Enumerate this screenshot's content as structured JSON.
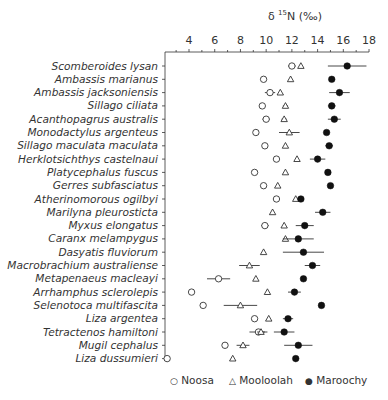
{
  "chart_data": {
    "type": "scatter",
    "title": "",
    "xlabel": "δ 15N (‰)",
    "xlabel_parts": {
      "delta": "δ",
      "sup": "15",
      "rest": "N (‰)"
    },
    "ylabel": "",
    "xlim": [
      2,
      18
    ],
    "xticks": [
      4,
      6,
      8,
      10,
      12,
      14,
      16,
      18
    ],
    "x_axis_position": "top",
    "grid": false,
    "legend_position": "bottom",
    "categories": [
      "Scomberoides lysan",
      "Ambassis marianus",
      "Ambassis jacksoniensis",
      "Sillago ciliata",
      "Acanthopagrus australis",
      "Monodactylus argenteus",
      "Sillago maculata maculata",
      "Herklotsichthys castelnaui",
      "Platycephalus fuscus",
      "Gerres subfasciatus",
      "Atherinomorous ogilbyi",
      "Marilyna pleurosticta",
      "Myxus elongatus",
      "Caranx melampygus",
      "Dasyatis fluviorum",
      "Macrobrachium australiense",
      "Metapenaeus macleayi",
      "Arrhamphus sclerolepis",
      "Selenotoca multifascita",
      "Liza argentea",
      "Tetractenos hamiltoni",
      "Mugil cephalus",
      "Liza dussumieri"
    ],
    "series": [
      {
        "name": "Noosa",
        "marker": "open-circle",
        "values": [
          12.0,
          9.8,
          10.3,
          9.7,
          10.0,
          9.2,
          9.9,
          10.8,
          9.1,
          9.8,
          10.8,
          null,
          9.9,
          null,
          null,
          null,
          6.3,
          4.2,
          5.1,
          9.1,
          9.4,
          6.8,
          2.3
        ],
        "errors": [
          0.3,
          0,
          0.4,
          0,
          0.3,
          0,
          0,
          0,
          0,
          0,
          0,
          null,
          0.3,
          null,
          null,
          null,
          0.9,
          0,
          0,
          0,
          0.7,
          0,
          0.2
        ]
      },
      {
        "name": "Mooloolah",
        "marker": "open-triangle",
        "values": [
          12.7,
          11.9,
          11.1,
          11.5,
          11.4,
          11.8,
          11.5,
          12.4,
          11.5,
          10.9,
          12.3,
          10.5,
          11.4,
          11.5,
          9.8,
          8.7,
          9.2,
          10.1,
          8.0,
          10.2,
          9.6,
          8.2,
          7.4
        ],
        "errors": [
          0,
          0,
          0,
          0.2,
          0.2,
          0.8,
          0,
          0,
          0,
          0,
          0,
          0,
          0,
          0,
          0,
          0.8,
          0,
          0,
          1.3,
          0,
          0.3,
          0.5,
          0
        ]
      },
      {
        "name": "Maroochy",
        "marker": "filled-circle",
        "values": [
          16.3,
          15.1,
          15.7,
          15.1,
          15.3,
          14.7,
          14.9,
          14.0,
          14.8,
          15.0,
          12.7,
          14.4,
          13.0,
          12.5,
          12.9,
          13.6,
          12.9,
          12.2,
          14.3,
          11.7,
          11.4,
          12.5,
          12.3
        ],
        "errors": [
          1.5,
          0,
          0.8,
          0.3,
          0.5,
          0,
          0.3,
          0.6,
          0,
          0,
          0,
          0.6,
          0.7,
          1.2,
          1.6,
          0.6,
          0,
          0.5,
          0,
          0.4,
          0.8,
          1.1,
          0
        ]
      }
    ]
  },
  "axis": {
    "title_delta": "δ ",
    "title_sup": "15",
    "title_rest": "N (‰)"
  },
  "legend": [
    {
      "symbol": "○",
      "label": "Noosa"
    },
    {
      "symbol": "△",
      "label": "Mooloolah"
    },
    {
      "symbol": "●",
      "label": "Maroochy"
    }
  ]
}
